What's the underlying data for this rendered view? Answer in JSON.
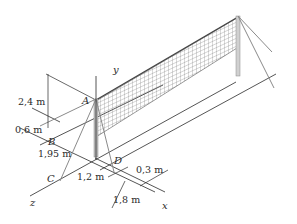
{
  "figure": {
    "axes": {
      "x": "x",
      "y": "y",
      "z": "z"
    },
    "points": {
      "A": "A",
      "B": "B",
      "C": "C",
      "D": "D"
    },
    "dimensions": {
      "height_A": "2,4 m",
      "offset_B": "0,6 m",
      "dist_B": "1,95 m",
      "dist_C_D": "1,2 m",
      "offset_D": "0,3 m",
      "dist_x": "1,8 m"
    },
    "colors": {
      "line": "#2a2a2a",
      "pole": "#9a9a9a",
      "net": "#555555",
      "guy": "#8a8a8a"
    }
  }
}
